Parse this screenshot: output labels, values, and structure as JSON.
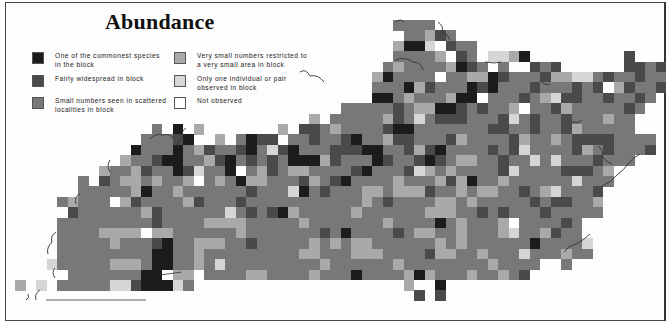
{
  "title": "Abundance",
  "legend": [
    {
      "level": 1,
      "label": "One of the commonest species\nin the block",
      "color": "#1c1c1c"
    },
    {
      "level": 2,
      "label": "Fairly widespread in block",
      "color": "#4a4a4a"
    },
    {
      "level": 3,
      "label": "Small numbers seen in scattered\nlocalities in block",
      "color": "#787878"
    },
    {
      "level": 4,
      "label": "Very small numbers restricted to\na very small area in block",
      "color": "#a9a9a9"
    },
    {
      "level": 5,
      "label": "Only one individual or pair\nobserved in block",
      "color": "#d6d6d6"
    },
    {
      "level": 0,
      "label": "Not observed",
      "color": "#ffffff"
    }
  ],
  "map": {
    "region": "Kentucky",
    "grid_origin": {
      "x": 15,
      "y": 20
    },
    "cell_size": {
      "w": 10.5,
      "h": 10.4
    },
    "legend_key": {
      ".": "outside",
      "0": "not observed",
      "1": "commonest",
      "2": "fairly widespread",
      "3": "small numbers",
      "4": "very small numbers",
      "5": "one individual or pair"
    },
    "rows": [
      "....................................3333......................",
      ".....................................33423....................",
      "....................................41150233..................",
      "....................................3333402305541.........2...",
      "...................................343333412303..232......2232",
      "..................................4133330334412333244553233233",
      "..................................3331423331213332333232042332",
      ".................................0113433341103332345223323323.",
      "...............................33333234411232334033243333323..",
      "............................4.33333423532223332532332333433...",
      ".............3.1.4.......4.22343333211333333322332332433333....",
      "............33321..4.3122.33233213342233324333324334322223333.",
      "...........13331342332135213332221133242133332325333324323332.",
      "..........4332113342132323111423331233212344332335353332333...",
      "........4334233125331034234433332133325434333325333322234.....",
      "......3.2344343340343144333243213333433342413343333335333.....",
      "......33333413343333332333513233344344423343443323453332......",
      "....3433304233334233323333333333343233334434333332322334......",
      ".....233333342333333532321433333433333344433232333233333......",
      "....33333333323333444433333433333334333313433340333323.......",
      "....33334444044333333433333332313333234433433345334233........",
      "....333334333213344433233333434344333333434333333133335........",
      "....333333333113343333333334433344433332443343335333433.......",
      "...53333344431133435333333333433333343333333343333..3.........",
      ".....33333331104403333443333433313333414333433432.............",
      "4.5.3333355211153....................4..1.................... ",
      "......................................2.2....................."
    ]
  }
}
